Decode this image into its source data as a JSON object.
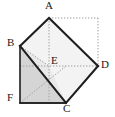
{
  "figure": {
    "background_color": "#ffffff",
    "stroke_color": "#1a1a1a",
    "dotted_color": "#9a9a9a",
    "fill_light": "#f0f0f0",
    "fill_mid": "#ebebeb",
    "fill_dark": "#d4d4d4",
    "labels": [
      {
        "id": "A",
        "text": "A",
        "x": 45,
        "y": 0
      },
      {
        "id": "B",
        "text": "B",
        "x": 7,
        "y": 37
      },
      {
        "id": "E",
        "text": "E",
        "x": 51,
        "y": 55
      },
      {
        "id": "D",
        "text": "D",
        "x": 101,
        "y": 59
      },
      {
        "id": "F",
        "text": "F",
        "x": 7,
        "y": 92
      },
      {
        "id": "C",
        "text": "C",
        "x": 63,
        "y": 103
      }
    ],
    "vertices": {
      "A": {
        "x": 49,
        "y": 18
      },
      "B": {
        "x": 20,
        "y": 46
      },
      "C": {
        "x": 66,
        "y": 103
      },
      "D": {
        "x": 98,
        "y": 66
      },
      "E": {
        "x": 49,
        "y": 66
      },
      "F": {
        "x": 20,
        "y": 103
      },
      "TR": {
        "x": 98,
        "y": 18
      }
    },
    "solid_edges": [
      "A-B",
      "A-D",
      "B-C",
      "C-D",
      "B-F",
      "F-C"
    ],
    "dotted_edges": [
      "A-E",
      "E-C",
      "B-E",
      "E-D",
      "A-TR",
      "TR-D",
      "A-C-diagonal",
      "B-C-diagonal",
      "F-E-diagonal"
    ],
    "shaded_regions": [
      {
        "name": "square-ABDC-upper",
        "fill": "#f2f2f2"
      },
      {
        "name": "triangle-BFC",
        "fill": "#d4d4d4"
      },
      {
        "name": "triangle-BEC",
        "fill": "#e8e8e8"
      }
    ]
  }
}
